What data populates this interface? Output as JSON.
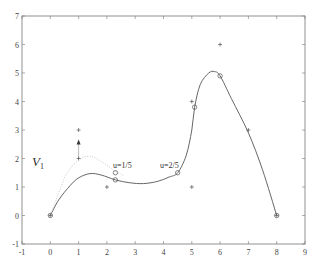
{
  "chart_data": {
    "type": "line",
    "title": "",
    "xlabel": "",
    "ylabel": "",
    "xlim": [
      -1,
      9
    ],
    "ylim": [
      -1,
      7
    ],
    "grid": false,
    "x_ticks": [
      "-1",
      "0",
      "1",
      "2",
      "3",
      "4",
      "5",
      "6",
      "7",
      "8",
      "9"
    ],
    "y_ticks": [
      "-1",
      "0",
      "1",
      "2",
      "3",
      "4",
      "5",
      "6",
      "7"
    ],
    "series": [
      {
        "name": "curve",
        "style": "solid",
        "points": [
          [
            0,
            0
          ],
          [
            0.3,
            0.55
          ],
          [
            0.7,
            1.05
          ],
          [
            1.0,
            1.32
          ],
          [
            1.4,
            1.47
          ],
          [
            1.8,
            1.42
          ],
          [
            2.3,
            1.25
          ],
          [
            2.8,
            1.15
          ],
          [
            3.3,
            1.12
          ],
          [
            3.8,
            1.2
          ],
          [
            4.2,
            1.35
          ],
          [
            4.5,
            1.5
          ],
          [
            4.8,
            2.1
          ],
          [
            5.0,
            3.0
          ],
          [
            5.1,
            3.8
          ],
          [
            5.3,
            4.6
          ],
          [
            5.6,
            5.0
          ],
          [
            5.8,
            5.05
          ],
          [
            6.0,
            4.9
          ],
          [
            6.4,
            4.1
          ],
          [
            7.0,
            2.9
          ],
          [
            7.5,
            1.6
          ],
          [
            8.0,
            0
          ]
        ]
      },
      {
        "name": "dotted-curve",
        "style": "dotted",
        "points": [
          [
            0,
            0
          ],
          [
            0.3,
            0.8
          ],
          [
            0.6,
            1.5
          ],
          [
            1.0,
            1.95
          ],
          [
            1.4,
            2.08
          ],
          [
            1.8,
            1.9
          ],
          [
            2.3,
            1.55
          ],
          [
            2.6,
            1.4
          ]
        ]
      }
    ],
    "control_points": [
      [
        0,
        0
      ],
      [
        1,
        2
      ],
      [
        1,
        3
      ],
      [
        2,
        1
      ],
      [
        5,
        1
      ],
      [
        5,
        4
      ],
      [
        6,
        6
      ],
      [
        7,
        3
      ],
      [
        8,
        0
      ]
    ],
    "circle_markers": [
      [
        0,
        0
      ],
      [
        2.3,
        1.5
      ],
      [
        2.3,
        1.25
      ],
      [
        4.5,
        1.5
      ],
      [
        5.1,
        3.8
      ],
      [
        6.0,
        4.9
      ],
      [
        8,
        0
      ]
    ],
    "arrow": {
      "from": [
        1,
        2.0
      ],
      "to": [
        1,
        2.6
      ]
    },
    "annotations": [
      {
        "text": "V1",
        "x": 0.3,
        "y": 1.8
      },
      {
        "text": "u=1/5",
        "x": 2.3,
        "y": 1.75
      },
      {
        "text": "u=2/5",
        "x": 3.9,
        "y": 1.75
      }
    ]
  },
  "labels": {
    "v_main": "V",
    "v_sub": "1",
    "u1": "u=1/5",
    "u2": "u=2/5"
  }
}
